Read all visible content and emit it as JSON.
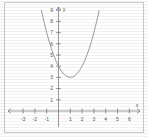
{
  "chart_data": {
    "type": "line",
    "title": "",
    "subtitle": "",
    "xlabel": "x",
    "ylabel": "y",
    "xlim": [
      -3.6,
      6.2
    ],
    "ylim": [
      -0.6,
      9.4
    ],
    "grid": false,
    "legend": null,
    "x_ticks": [
      -3,
      -2,
      -1,
      1,
      2,
      3,
      4,
      5,
      6
    ],
    "x_tick_labels": [
      "-3",
      "-2",
      "-1",
      "1",
      "2",
      "3",
      "4",
      "5",
      "6"
    ],
    "y_ticks": [
      1,
      2,
      3,
      4,
      5,
      6,
      7,
      8,
      9
    ],
    "y_tick_labels": [
      "1",
      "2",
      "3",
      "4",
      "5",
      "6",
      "7",
      "8",
      "9"
    ],
    "curve_label": "parabola",
    "vertex": {
      "x": 1,
      "y": 3
    },
    "y_intercept": 4,
    "equation": "y = (x - 1)^2 + 3",
    "series": [
      {
        "name": "parabola",
        "x": [
          -1.45,
          -1.2,
          -1.0,
          -0.8,
          -0.6,
          -0.4,
          -0.2,
          0.0,
          0.2,
          0.4,
          0.6,
          0.8,
          1.0,
          1.2,
          1.4,
          1.6,
          1.8,
          2.0,
          2.2,
          2.4,
          2.6,
          2.8,
          3.0,
          3.2,
          3.45
        ],
        "y": [
          9.0,
          7.84,
          7.0,
          6.24,
          5.56,
          4.96,
          4.44,
          4.0,
          3.64,
          3.36,
          3.16,
          3.04,
          3.0,
          3.04,
          3.16,
          3.36,
          3.64,
          4.0,
          4.44,
          4.96,
          5.56,
          6.24,
          7.0,
          7.84,
          9.0
        ]
      }
    ]
  },
  "axis": {
    "x_name": "x",
    "y_name": "y"
  }
}
